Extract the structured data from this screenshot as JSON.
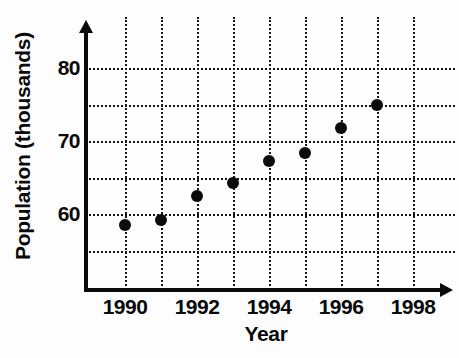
{
  "chart_data": {
    "type": "scatter",
    "title": "",
    "xlabel": "Year",
    "ylabel": "Population (thousands)",
    "x": [
      1990,
      1991,
      1992,
      1993,
      1994,
      1995,
      1996,
      1997
    ],
    "values": [
      58.5,
      59.2,
      62.5,
      64.3,
      67.2,
      68.4,
      71.8,
      75.0
    ],
    "series": [
      {
        "name": "Population",
        "points": [
          {
            "x": 1990,
            "y": 58.5
          },
          {
            "x": 1991,
            "y": 59.2
          },
          {
            "x": 1992,
            "y": 62.5
          },
          {
            "x": 1993,
            "y": 64.3
          },
          {
            "x": 1994,
            "y": 67.2
          },
          {
            "x": 1995,
            "y": 68.4
          },
          {
            "x": 1996,
            "y": 71.8
          },
          {
            "x": 1997,
            "y": 75.0
          }
        ]
      }
    ],
    "xlim": [
      1989.0,
      1998.9
    ],
    "ylim": [
      51.5,
      84.5
    ],
    "xticks": [
      1990,
      1992,
      1994,
      1996,
      1998
    ],
    "xtick_labels": [
      "1990",
      "1992",
      "1994",
      "1996",
      "1998"
    ],
    "x_gridlines": [
      1990,
      1991,
      1992,
      1993,
      1994,
      1995,
      1996,
      1997,
      1998
    ],
    "yticks": [
      60,
      70,
      80
    ],
    "ytick_labels": [
      "60",
      "70",
      "80"
    ],
    "y_gridlines": [
      55,
      60,
      65,
      70,
      75,
      80
    ],
    "grid": true,
    "grid_style": "dotted",
    "legend": "none",
    "marker": "filled-circle",
    "marker_color": "#0b0b0b",
    "axis_color": "#0a0a0a",
    "background": "#ffffff"
  },
  "axis_labels": {
    "y": "Population (thousands)",
    "x": "Year"
  }
}
